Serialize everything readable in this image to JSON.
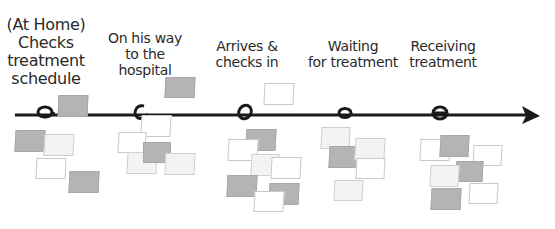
{
  "diagram": {
    "type": "customer-journey-timeline",
    "colors": {
      "line": "#1a1a1a",
      "text": "#2a2a2a",
      "note_dark": "#b4b4b4",
      "note_light": "#ffffff",
      "note_pale": "#f3f3f3"
    },
    "stages": [
      {
        "id": "home",
        "lines": [
          "(At Home)",
          "Checks",
          "treatment",
          "schedule"
        ],
        "marker_x": 45
      },
      {
        "id": "way",
        "lines": [
          "On his way",
          "to the",
          "hospital"
        ],
        "marker_x": 140
      },
      {
        "id": "arrives",
        "lines": [
          "Arrives &",
          "checks in"
        ],
        "marker_x": 245
      },
      {
        "id": "waiting",
        "lines": [
          "Waiting",
          "for treatment"
        ],
        "marker_x": 345
      },
      {
        "id": "receiving",
        "lines": [
          "Receiving",
          "treatment"
        ],
        "marker_x": 440
      }
    ]
  }
}
